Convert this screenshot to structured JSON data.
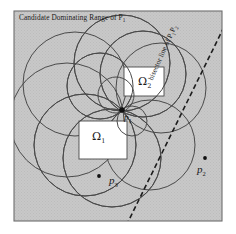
{
  "figure": {
    "type": "geometric-diagram",
    "title": "Candidate Dominating Range of P",
    "title_subscript": "1",
    "background_color": "#ffffff",
    "shaded_region_color": "#c6c6c6",
    "stroke_color": "#3a3a3a",
    "white_region_color": "#ffffff"
  },
  "labels": {
    "omega1": "Ω",
    "omega1_sub": "1",
    "omega2": "Ω",
    "omega2_sub": "2",
    "p1": "p",
    "p1_sub": "1",
    "p2": "p",
    "p2_sub": "2",
    "p3": "p",
    "p3_sub": "3",
    "bisector": "bisector line of P P",
    "bisector_sub1": "1",
    "bisector_sub2": "2",
    "bisector_text": "bisector line of P",
    "bisector_text_mid": "P",
    "bisector_text_end": ""
  },
  "geometry": {
    "frame": {
      "x": 14,
      "y": 11,
      "width": 208,
      "height": 210
    },
    "points": [
      {
        "name": "p1",
        "x": 122,
        "y": 110,
        "radius": 2.6
      },
      {
        "name": "p2",
        "x": 205,
        "y": 158,
        "radius": 1.8
      },
      {
        "name": "p3",
        "x": 99,
        "y": 176,
        "radius": 1.8
      }
    ],
    "circles": [
      {
        "cx": 122,
        "cy": 63,
        "r": 48
      },
      {
        "cx": 143,
        "cy": 74,
        "r": 43
      },
      {
        "cx": 161,
        "cy": 88,
        "r": 45
      },
      {
        "cx": 100,
        "cy": 86,
        "r": 33
      },
      {
        "cx": 75,
        "cy": 84,
        "r": 52
      },
      {
        "cx": 67,
        "cy": 120,
        "r": 57
      },
      {
        "cx": 85,
        "cy": 145,
        "r": 51
      },
      {
        "cx": 112,
        "cy": 158,
        "r": 49
      },
      {
        "cx": 150,
        "cy": 145,
        "r": 45
      },
      {
        "cx": 132,
        "cy": 121,
        "r": 15
      },
      {
        "cx": 116,
        "cy": 95,
        "r": 18
      }
    ],
    "white_rects": [
      {
        "name": "omega2",
        "x": 124,
        "y": 67,
        "width": 40,
        "height": 29
      },
      {
        "name": "omega1",
        "x": 79,
        "y": 121,
        "width": 48,
        "height": 38
      }
    ],
    "bisector_line": {
      "x1": 224,
      "y1": 27,
      "x2": 127,
      "y2": 224,
      "dash": "5,3"
    }
  }
}
